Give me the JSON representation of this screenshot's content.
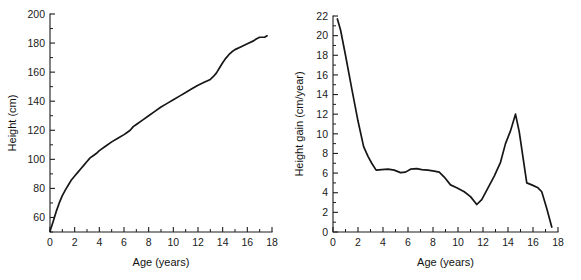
{
  "figure": {
    "background": "#ffffff",
    "line_color": "#161616",
    "axis_color": "#1c1c1c",
    "text_color": "#1a1a1a"
  },
  "chart_data": [
    {
      "id": "height-distance-curve",
      "type": "line",
      "title": "",
      "xlabel": "Age (years)",
      "ylabel": "Height (cm)",
      "xlim": [
        0,
        18
      ],
      "ylim": [
        50,
        200
      ],
      "xticks": [
        0,
        2,
        4,
        6,
        8,
        10,
        12,
        14,
        16,
        18
      ],
      "xtick_labels": [
        "0",
        "2",
        "4",
        "6",
        "8",
        "10",
        "12",
        "14",
        "16",
        "18"
      ],
      "xminor_step": 1,
      "yticks": [
        60,
        80,
        100,
        120,
        140,
        160,
        180,
        200
      ],
      "ytick_labels": [
        "60",
        "80",
        "100",
        "120",
        "140",
        "160",
        "180",
        "200"
      ],
      "yminor_step": 10,
      "grid": false,
      "legend": "none",
      "series": [
        {
          "name": "Height",
          "x": [
            0.0,
            0.25,
            0.5,
            0.75,
            1.0,
            1.25,
            1.5,
            1.75,
            2.0,
            2.25,
            2.5,
            2.75,
            3.0,
            3.25,
            3.5,
            3.75,
            4.0,
            4.5,
            5.0,
            5.5,
            6.0,
            6.25,
            6.5,
            6.75,
            7.0,
            7.5,
            8.0,
            8.5,
            9.0,
            9.5,
            10.0,
            10.5,
            11.0,
            11.5,
            12.0,
            12.5,
            13.0,
            13.25,
            13.5,
            13.75,
            14.0,
            14.25,
            14.5,
            14.75,
            15.0,
            15.5,
            16.0,
            16.5,
            16.75,
            17.0,
            17.4,
            17.6
          ],
          "y": [
            50.5,
            57.0,
            64.0,
            70.0,
            75.0,
            79.0,
            82.5,
            86.0,
            88.5,
            91.0,
            93.5,
            96.0,
            98.5,
            101.0,
            102.5,
            104.0,
            106.0,
            109.0,
            112.0,
            114.5,
            117.0,
            118.5,
            120.0,
            122.5,
            124.0,
            127.0,
            130.0,
            133.0,
            136.0,
            138.5,
            141.0,
            143.5,
            146.0,
            148.5,
            151.0,
            153.0,
            155.0,
            157.0,
            159.5,
            163.0,
            166.5,
            169.5,
            172.0,
            174.0,
            175.5,
            177.5,
            179.5,
            181.5,
            183.0,
            184.0,
            184.0,
            185.0
          ]
        }
      ]
    },
    {
      "id": "height-gain-velocity-curve",
      "type": "line",
      "title": "",
      "xlabel": "Age (years)",
      "ylabel": "Height gain (cm/year)",
      "xlim": [
        0,
        18
      ],
      "ylim": [
        0,
        22
      ],
      "xticks": [
        0,
        2,
        4,
        6,
        8,
        10,
        12,
        14,
        16,
        18
      ],
      "xtick_labels": [
        "0",
        "2",
        "4",
        "6",
        "8",
        "10",
        "12",
        "14",
        "16",
        "18"
      ],
      "xminor_step": 1,
      "yticks": [
        0,
        2,
        4,
        6,
        8,
        10,
        12,
        14,
        16,
        18,
        20,
        22
      ],
      "ytick_labels": [
        "0",
        "2",
        "4",
        "6",
        "8",
        "10",
        "12",
        "14",
        "16",
        "18",
        "20",
        "22"
      ],
      "yminor_step": 1,
      "grid": false,
      "legend": "none",
      "series": [
        {
          "name": "Height gain",
          "x": [
            0.35,
            0.6,
            1.0,
            1.5,
            2.0,
            2.45,
            2.8,
            3.1,
            3.45,
            3.9,
            4.4,
            4.9,
            5.4,
            5.8,
            6.2,
            6.7,
            7.1,
            7.6,
            8.1,
            8.5,
            8.9,
            9.4,
            9.9,
            10.5,
            11.0,
            11.5,
            11.9,
            12.4,
            12.9,
            13.4,
            13.8,
            14.2,
            14.6,
            14.9,
            15.2,
            15.5,
            15.9,
            16.4,
            16.7,
            17.1,
            17.5
          ],
          "y": [
            21.7,
            20.6,
            18.0,
            14.6,
            11.3,
            8.7,
            7.7,
            7.0,
            6.3,
            6.35,
            6.4,
            6.3,
            6.05,
            6.1,
            6.4,
            6.45,
            6.35,
            6.3,
            6.2,
            6.1,
            5.6,
            4.8,
            4.5,
            4.1,
            3.6,
            2.8,
            3.3,
            4.5,
            5.7,
            7.1,
            9.0,
            10.3,
            12.0,
            10.2,
            7.6,
            5.0,
            4.8,
            4.5,
            4.1,
            2.4,
            0.5
          ]
        }
      ]
    }
  ]
}
